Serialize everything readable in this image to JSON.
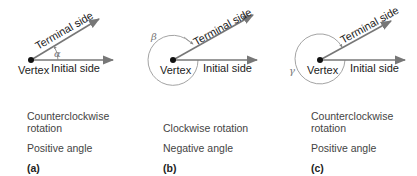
{
  "panels": [
    {
      "id": "a",
      "vertex_label": "Vertex",
      "terminal_label": "Terminal side",
      "initial_label": "Initial side",
      "angle_symbol": "α",
      "rotation": "Counterclockwise rotation",
      "rotation_line1": "Counterclockwise",
      "rotation_line2": "rotation",
      "sign": "Positive angle",
      "tag": "(a)"
    },
    {
      "id": "b",
      "vertex_label": "Vertex",
      "terminal_label": "Terminal side",
      "initial_label": "Initial side",
      "angle_symbol": "β",
      "rotation": "Clockwise rotation",
      "rotation_line1": "",
      "rotation_line2": "Clockwise rotation",
      "sign": "Negative angle",
      "tag": "(b)"
    },
    {
      "id": "c",
      "vertex_label": "Vertex",
      "terminal_label": "Terminal side",
      "initial_label": "Initial side",
      "angle_symbol": "γ",
      "rotation": "Counterclockwise rotation",
      "rotation_line1": "Counterclockwise",
      "rotation_line2": "rotation",
      "sign": "Positive angle",
      "tag": "(c)"
    }
  ],
  "colors": {
    "ray": "#777777",
    "vertex": "#111111",
    "circle": "#999999"
  }
}
